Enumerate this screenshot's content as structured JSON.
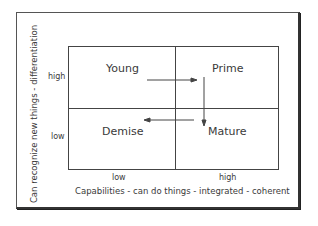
{
  "diagram": {
    "quadrants": {
      "top_left": "Young",
      "top_right": "Prime",
      "bottom_left": "Demise",
      "bottom_right": "Mature"
    },
    "y_axis": {
      "label": "Can recognize new things - differentiation",
      "ticks": [
        "high",
        "low"
      ]
    },
    "x_axis": {
      "label": "Capabilities - can do things - integrated - coherent",
      "ticks": [
        "low",
        "high"
      ]
    },
    "arrows": [
      {
        "from": "Young",
        "to": "Prime",
        "direction": "right"
      },
      {
        "from": "Prime",
        "to": "Mature",
        "direction": "down"
      },
      {
        "from": "Mature",
        "to": "Demise",
        "direction": "left"
      }
    ],
    "colors": {
      "line": "#444444",
      "text": "#3a3a3a",
      "background": "#ffffff"
    }
  }
}
